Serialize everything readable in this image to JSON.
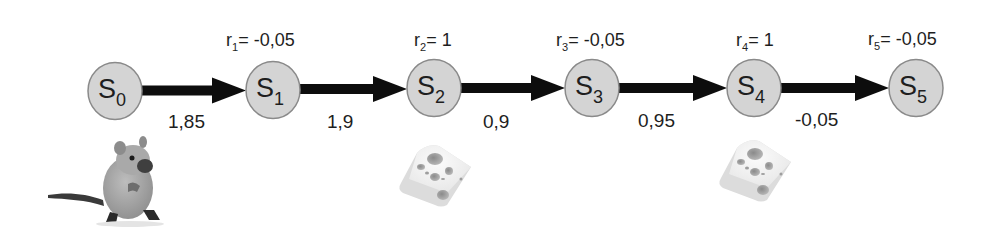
{
  "diagram": {
    "type": "markov-reward-chain",
    "colors": {
      "state_fill": "#d4d4d4",
      "state_stroke": "#8a8a8a",
      "arrow": "#0d0d0d",
      "text": "#1e1e1e"
    },
    "states": [
      {
        "id": "s0",
        "label": "S",
        "sub": "0",
        "cx": 115,
        "cy": 91
      },
      {
        "id": "s1",
        "label": "S",
        "sub": "1",
        "cx": 273,
        "cy": 90
      },
      {
        "id": "s2",
        "label": "S",
        "sub": "2",
        "cx": 434,
        "cy": 88
      },
      {
        "id": "s3",
        "label": "S",
        "sub": "3",
        "cx": 592,
        "cy": 88
      },
      {
        "id": "s4",
        "label": "S",
        "sub": "4",
        "cx": 754,
        "cy": 88
      },
      {
        "id": "s5",
        "label": "S",
        "sub": "5",
        "cx": 916,
        "cy": 88
      }
    ],
    "rewards": [
      {
        "state": "s1",
        "r": "r",
        "sub": "1",
        "value": "= -0,05",
        "x": 226,
        "y": 46
      },
      {
        "state": "s2",
        "r": "r",
        "sub": "2",
        "value": "= 1",
        "x": 414,
        "y": 46
      },
      {
        "state": "s3",
        "r": "r",
        "sub": "3",
        "value": "= -0,05",
        "x": 556,
        "y": 46
      },
      {
        "state": "s4",
        "r": "r",
        "sub": "4",
        "value": "= 1",
        "x": 736,
        "y": 46
      },
      {
        "state": "s5",
        "r": "r",
        "sub": "5",
        "value": "= -0,05",
        "x": 868,
        "y": 45
      }
    ],
    "transitions": [
      {
        "from": "s0",
        "to": "s1",
        "value": "1,85",
        "x": 168,
        "y": 128
      },
      {
        "from": "s1",
        "to": "s2",
        "value": "1,9",
        "x": 327,
        "y": 128
      },
      {
        "from": "s2",
        "to": "s3",
        "value": "0,9",
        "x": 483,
        "y": 128
      },
      {
        "from": "s3",
        "to": "s4",
        "value": "0,95",
        "x": 638,
        "y": 127
      },
      {
        "from": "s4",
        "to": "s5",
        "value": "-0,05",
        "x": 795,
        "y": 126
      }
    ],
    "images": [
      {
        "name": "mouse",
        "near": "s0"
      },
      {
        "name": "cheese",
        "near": "s2"
      },
      {
        "name": "cheese",
        "near": "s4"
      }
    ]
  }
}
